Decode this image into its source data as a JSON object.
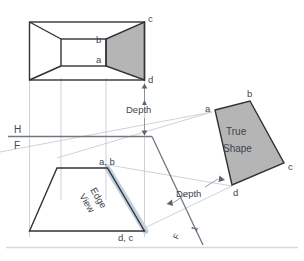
{
  "figure": {
    "title_visible": false,
    "colors": {
      "outline": "#2e3338",
      "shade_fill": "#b5b5b5",
      "projection_line": "#c9ccd1",
      "reference_line": "#6f7780",
      "highlight_edge": "#c3cfdd",
      "bottom_rule": "#d8d8d8",
      "text": "#3b4651"
    },
    "top_view": {
      "name": "top-view",
      "vertices_labels": [
        "c",
        "b",
        "a",
        "d"
      ],
      "shaded_face_label": "inclined-surface"
    },
    "front_view": {
      "name": "front-view",
      "vertices_labels": [
        "a, b",
        "d, c"
      ],
      "annotation": "Edge View",
      "annotation_line1": "Edge",
      "annotation_line2": "View"
    },
    "auxiliary_view": {
      "name": "auxiliary-view",
      "annotation_line1": "True",
      "annotation_line2": "Shape",
      "vertices_labels": [
        "a",
        "b",
        "c",
        "d"
      ]
    },
    "reference_lines": {
      "h_label": "H",
      "f_label": "F",
      "fold_f_label": "F",
      "fold_1_label": "1"
    },
    "dimensions": {
      "depth_top": "Depth",
      "depth_aux": "Depth"
    },
    "point_labels": {
      "top_c": "c",
      "top_b": "b",
      "top_a": "a",
      "top_d": "d",
      "front_ab": "a, b",
      "front_dc": "d, c",
      "aux_a": "a",
      "aux_b": "b",
      "aux_c": "c",
      "aux_d": "d"
    }
  }
}
